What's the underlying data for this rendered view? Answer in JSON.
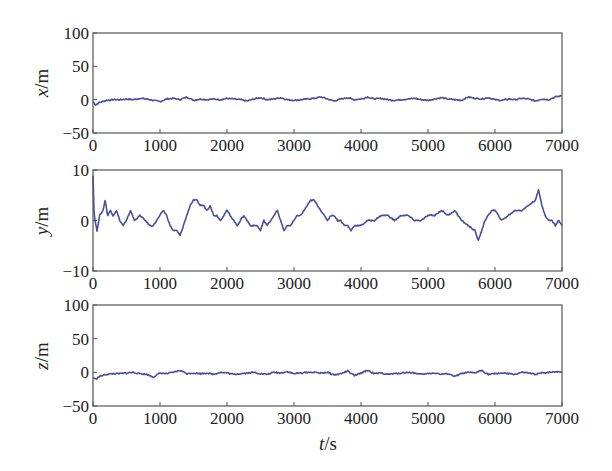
{
  "figure": {
    "xlabel_var": "t",
    "xlabel_unit": "/s",
    "trace_color": "#4a4e9c"
  },
  "chart_data": [
    {
      "type": "line",
      "name": "x",
      "ylabel_var": "x",
      "ylabel_unit": "/m",
      "xlabel": "t/s",
      "ylabel": "x/m",
      "xlim": [
        0,
        7000
      ],
      "ylim": [
        -50,
        100
      ],
      "xticks": [
        0,
        1000,
        2000,
        3000,
        4000,
        5000,
        6000,
        7000
      ],
      "yticks": [
        -50,
        0,
        50,
        100
      ],
      "xtick_labels": [
        "0",
        "1000",
        "2000",
        "3000",
        "4000",
        "5000",
        "6000",
        "7000"
      ],
      "ytick_labels": [
        "−50",
        "0",
        "50",
        "100"
      ],
      "grid": false,
      "series": [
        {
          "name": "x",
          "x": [
            0,
            40,
            100,
            200,
            300,
            400,
            500,
            600,
            700,
            800,
            900,
            1000,
            1100,
            1200,
            1300,
            1400,
            1500,
            1600,
            1700,
            1800,
            1900,
            2000,
            2100,
            2200,
            2300,
            2400,
            2500,
            2600,
            2700,
            2800,
            2900,
            3000,
            3100,
            3200,
            3300,
            3400,
            3500,
            3600,
            3700,
            3800,
            3900,
            4000,
            4100,
            4200,
            4300,
            4400,
            4500,
            4600,
            4700,
            4800,
            4900,
            5000,
            5100,
            5200,
            5300,
            5400,
            5500,
            5600,
            5700,
            5800,
            5900,
            6000,
            6100,
            6200,
            6300,
            6400,
            6500,
            6600,
            6700,
            6800,
            6900,
            7000
          ],
          "values": [
            -3,
            -8,
            -4,
            -1,
            0,
            0,
            1,
            0,
            2,
            1,
            -1,
            -3,
            1,
            2,
            0,
            4,
            -1,
            1,
            0,
            1,
            0,
            2,
            1,
            0,
            -2,
            1,
            3,
            0,
            1,
            3,
            0,
            -1,
            0,
            1,
            2,
            4,
            1,
            -2,
            1,
            3,
            0,
            1,
            4,
            1,
            2,
            0,
            -1,
            0,
            1,
            2,
            0,
            -1,
            1,
            3,
            1,
            0,
            -1,
            4,
            2,
            1,
            3,
            0,
            -1,
            1,
            0,
            2,
            1,
            -2,
            1,
            0,
            4,
            6
          ]
        }
      ]
    },
    {
      "type": "line",
      "name": "y",
      "ylabel_var": "y",
      "ylabel_unit": "/m",
      "xlabel": "t/s",
      "ylabel": "y/m",
      "xlim": [
        0,
        7000
      ],
      "ylim": [
        -10,
        10
      ],
      "xticks": [
        0,
        1000,
        2000,
        3000,
        4000,
        5000,
        6000,
        7000
      ],
      "yticks": [
        -10,
        0,
        10
      ],
      "xtick_labels": [
        "0",
        "1000",
        "2000",
        "3000",
        "4000",
        "5000",
        "6000",
        "7000"
      ],
      "ytick_labels": [
        "−10",
        "0",
        "10"
      ],
      "grid": false,
      "series": [
        {
          "name": "y",
          "x": [
            0,
            15,
            30,
            60,
            100,
            150,
            180,
            220,
            260,
            300,
            350,
            400,
            450,
            500,
            560,
            620,
            700,
            780,
            850,
            900,
            950,
            1000,
            1050,
            1100,
            1150,
            1200,
            1250,
            1300,
            1350,
            1400,
            1450,
            1500,
            1550,
            1600,
            1650,
            1700,
            1750,
            1800,
            1850,
            1900,
            1950,
            2000,
            2050,
            2100,
            2150,
            2200,
            2250,
            2300,
            2350,
            2400,
            2450,
            2500,
            2550,
            2600,
            2650,
            2700,
            2750,
            2800,
            2850,
            2900,
            2950,
            3000,
            3050,
            3100,
            3150,
            3200,
            3250,
            3300,
            3350,
            3400,
            3450,
            3500,
            3550,
            3600,
            3650,
            3700,
            3750,
            3800,
            3850,
            3900,
            3950,
            4000,
            4100,
            4200,
            4300,
            4400,
            4500,
            4600,
            4700,
            4800,
            4900,
            5000,
            5100,
            5200,
            5300,
            5400,
            5450,
            5500,
            5600,
            5700,
            5750,
            5800,
            5850,
            5900,
            5950,
            6000,
            6050,
            6100,
            6200,
            6300,
            6400,
            6500,
            6600,
            6650,
            6700,
            6750,
            6800,
            6850,
            6900,
            6950,
            7000
          ],
          "values": [
            9,
            2,
            0,
            -2,
            1,
            2,
            4,
            1,
            2,
            1,
            2,
            0,
            -1,
            0,
            2,
            0,
            1,
            0,
            -1,
            -1,
            0,
            1,
            2,
            1,
            -1,
            -2,
            -2,
            -3,
            -1,
            1,
            3,
            4,
            4,
            3,
            3,
            2,
            3,
            1,
            1,
            0,
            1,
            2,
            1,
            0,
            -1,
            0,
            1,
            0,
            -1,
            -1,
            -1,
            -2,
            0,
            -1,
            0,
            1,
            2,
            0,
            -2,
            -1,
            -1,
            0,
            1,
            1,
            2,
            3,
            4,
            4,
            3,
            2,
            1,
            0,
            1,
            1,
            0,
            0,
            -1,
            -1,
            -2,
            -1,
            -1,
            -1,
            0,
            0,
            1,
            1,
            0,
            1,
            1,
            0,
            0,
            1,
            1,
            2,
            1,
            2,
            1,
            0,
            -1,
            -2,
            -4,
            -2,
            0,
            1,
            2,
            2,
            1,
            0,
            1,
            2,
            2,
            3,
            4,
            6,
            3,
            1,
            0,
            0,
            -1,
            0,
            -1
          ],
          "note": "values approximate, read off plot"
        }
      ]
    },
    {
      "type": "line",
      "name": "z",
      "ylabel_var": "z",
      "ylabel_unit": "/m",
      "xlabel": "t/s",
      "ylabel": "z/m",
      "xlim": [
        0,
        7000
      ],
      "ylim": [
        -50,
        100
      ],
      "xticks": [
        0,
        1000,
        2000,
        3000,
        4000,
        5000,
        6000,
        7000
      ],
      "yticks": [
        -50,
        0,
        50,
        100
      ],
      "xtick_labels": [
        "0",
        "1000",
        "2000",
        "3000",
        "4000",
        "5000",
        "6000",
        "7000"
      ],
      "ytick_labels": [
        "−50",
        "0",
        "50",
        "100"
      ],
      "grid": false,
      "series": [
        {
          "name": "z",
          "x": [
            0,
            40,
            100,
            200,
            300,
            400,
            500,
            600,
            700,
            800,
            900,
            1000,
            1100,
            1200,
            1300,
            1400,
            1500,
            1600,
            1700,
            1800,
            1900,
            2000,
            2100,
            2200,
            2300,
            2400,
            2500,
            2600,
            2700,
            2800,
            2900,
            3000,
            3100,
            3200,
            3300,
            3400,
            3500,
            3600,
            3700,
            3800,
            3900,
            4000,
            4100,
            4200,
            4300,
            4400,
            4500,
            4600,
            4700,
            4800,
            4900,
            5000,
            5100,
            5200,
            5300,
            5400,
            5500,
            5600,
            5700,
            5800,
            5900,
            6000,
            6100,
            6200,
            6300,
            6400,
            6500,
            6600,
            6700,
            6800,
            6900,
            7000
          ],
          "values": [
            -8,
            -10,
            -6,
            -3,
            -2,
            -2,
            -1,
            0,
            -2,
            -3,
            -7,
            -1,
            -2,
            0,
            3,
            -2,
            -1,
            -2,
            -1,
            -3,
            0,
            -1,
            -3,
            -2,
            -1,
            0,
            -2,
            -3,
            0,
            -1,
            1,
            -2,
            -1,
            0,
            0,
            -1,
            0,
            -4,
            -2,
            2,
            -5,
            -1,
            3,
            -2,
            -1,
            -3,
            -2,
            -1,
            0,
            -1,
            -3,
            -2,
            -1,
            -3,
            -2,
            -6,
            -2,
            0,
            -1,
            3,
            -3,
            -2,
            -1,
            -2,
            -3,
            0,
            -1,
            -3,
            -1,
            0,
            1,
            1
          ]
        }
      ]
    }
  ]
}
